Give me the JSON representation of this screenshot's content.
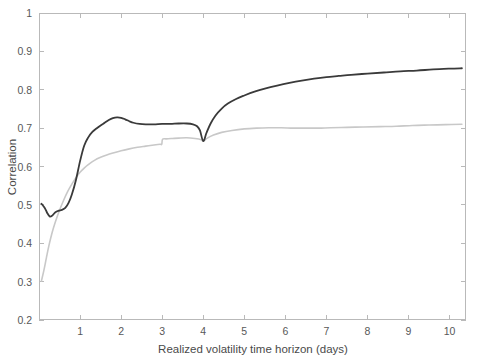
{
  "figure": {
    "background_color": "#ffffff",
    "axis_color": "#b9b9b9",
    "tick_label_color": "#585858",
    "axis_title_color": "#4a4a4a"
  },
  "chart_data": {
    "type": "line",
    "title": "",
    "subtitle": "",
    "xlabel": "Realized volatility time horizon (days)",
    "ylabel": "Correlation",
    "xlim": [
      0,
      10.4
    ],
    "ylim": [
      0.2,
      1.0
    ],
    "xticks": [
      1,
      2,
      3,
      4,
      5,
      6,
      7,
      8,
      9,
      10
    ],
    "xtick_labels": [
      "1",
      "2",
      "3",
      "4",
      "5",
      "6",
      "7",
      "8",
      "9",
      "10"
    ],
    "yticks": [
      0.2,
      0.3,
      0.4,
      0.5,
      0.6,
      0.7,
      0.8,
      0.9,
      1.0
    ],
    "ytick_labels": [
      "0.2",
      "0.3",
      "0.4",
      "0.5",
      "0.6",
      "0.7",
      "0.8",
      "0.9",
      "1"
    ],
    "grid": false,
    "legend": null,
    "legend_position": "none",
    "annotations": [],
    "series": [
      {
        "name": "dark-series",
        "color": "#3a3a3a",
        "line_width": 1.8,
        "x": [
          0.06,
          0.14,
          0.2,
          0.26,
          0.32,
          0.4,
          0.48,
          0.56,
          0.64,
          0.72,
          0.8,
          0.9,
          1.0,
          1.1,
          1.2,
          1.3,
          1.4,
          1.5,
          1.6,
          1.7,
          1.8,
          1.9,
          2.0,
          2.1,
          2.2,
          2.3,
          2.45,
          2.6,
          2.8,
          3.0,
          3.2,
          3.4,
          3.6,
          3.75,
          3.85,
          3.92,
          4.0,
          4.08,
          4.18,
          4.3,
          4.45,
          4.6,
          4.8,
          5.0,
          5.25,
          5.5,
          5.8,
          6.1,
          6.4,
          6.7,
          7.0,
          7.3,
          7.6,
          8.0,
          8.4,
          8.8,
          9.2,
          9.6,
          10.0,
          10.3
        ],
        "y": [
          0.503,
          0.492,
          0.479,
          0.47,
          0.472,
          0.481,
          0.485,
          0.487,
          0.492,
          0.505,
          0.527,
          0.565,
          0.614,
          0.654,
          0.676,
          0.69,
          0.699,
          0.707,
          0.714,
          0.721,
          0.726,
          0.728,
          0.727,
          0.723,
          0.718,
          0.714,
          0.711,
          0.71,
          0.71,
          0.711,
          0.711,
          0.712,
          0.712,
          0.71,
          0.705,
          0.694,
          0.666,
          0.688,
          0.712,
          0.733,
          0.751,
          0.764,
          0.776,
          0.785,
          0.795,
          0.803,
          0.811,
          0.818,
          0.824,
          0.829,
          0.833,
          0.836,
          0.839,
          0.842,
          0.845,
          0.848,
          0.85,
          0.853,
          0.855,
          0.856
        ]
      },
      {
        "name": "light-series",
        "color": "#c8c8c8",
        "line_width": 1.6,
        "x": [
          0.06,
          0.12,
          0.18,
          0.24,
          0.32,
          0.4,
          0.5,
          0.6,
          0.7,
          0.8,
          0.9,
          1.0,
          1.1,
          1.2,
          1.35,
          1.5,
          1.65,
          1.8,
          2.0,
          2.2,
          2.4,
          2.6,
          2.8,
          2.95,
          2.99,
          3.01,
          3.1,
          3.25,
          3.4,
          3.6,
          3.8,
          3.95,
          4.0,
          4.1,
          4.25,
          4.45,
          4.7,
          5.0,
          5.3,
          5.6,
          5.9,
          6.2,
          6.5,
          6.8,
          7.1,
          7.5,
          7.9,
          8.3,
          8.7,
          9.1,
          9.5,
          9.9,
          10.3
        ],
        "y": [
          0.302,
          0.33,
          0.362,
          0.393,
          0.428,
          0.456,
          0.486,
          0.512,
          0.535,
          0.554,
          0.571,
          0.585,
          0.596,
          0.605,
          0.616,
          0.624,
          0.63,
          0.635,
          0.641,
          0.646,
          0.65,
          0.653,
          0.656,
          0.658,
          0.658,
          0.671,
          0.672,
          0.673,
          0.674,
          0.675,
          0.673,
          0.67,
          0.666,
          0.674,
          0.682,
          0.689,
          0.694,
          0.698,
          0.7,
          0.701,
          0.701,
          0.7,
          0.7,
          0.7,
          0.701,
          0.702,
          0.703,
          0.704,
          0.705,
          0.707,
          0.708,
          0.709,
          0.71
        ]
      }
    ]
  }
}
